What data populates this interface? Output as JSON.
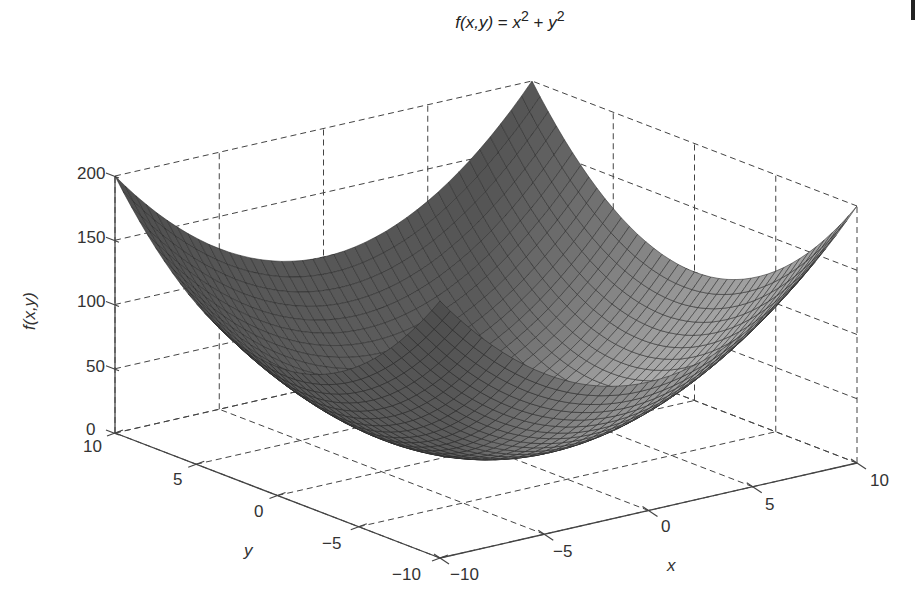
{
  "chart_data": {
    "type": "surface",
    "title_parts": {
      "lhs": "f(x,y)",
      "eq": " = ",
      "x": "x",
      "xexp": "2",
      "plus": " + ",
      "y": "y",
      "yexp": "2"
    },
    "function": "x^2 + y^2",
    "xlabel": "x",
    "ylabel": "y",
    "zlabel": "f(x,y)",
    "xlim": [
      -10,
      10
    ],
    "ylim": [
      -10,
      10
    ],
    "zlim": [
      0,
      200
    ],
    "xticks": [
      "-10",
      "-5",
      "0",
      "5",
      "10"
    ],
    "yticks": [
      "-10",
      "-5",
      "0",
      "5",
      "10"
    ],
    "zticks": [
      "0",
      "50",
      "100",
      "150",
      "200"
    ],
    "grid": true,
    "grid_style": "dashed",
    "mesh_resolution": 41,
    "colormap": "gray",
    "sample_values": [
      {
        "x": -10,
        "y": -10,
        "z": 200
      },
      {
        "x": -10,
        "y": 10,
        "z": 200
      },
      {
        "x": 10,
        "y": -10,
        "z": 200
      },
      {
        "x": 10,
        "y": 10,
        "z": 200
      },
      {
        "x": 0,
        "y": 0,
        "z": 0
      },
      {
        "x": 5,
        "y": 5,
        "z": 50
      },
      {
        "x": -5,
        "y": 5,
        "z": 50
      },
      {
        "x": 10,
        "y": 0,
        "z": 100
      },
      {
        "x": 0,
        "y": 10,
        "z": 100
      }
    ]
  },
  "labels": {
    "x_minus10": "−10",
    "x_minus5": "−5",
    "x_0": "0",
    "x_5": "5",
    "x_10": "10",
    "y_minus10": "−10",
    "y_minus5": "−5",
    "y_0": "0",
    "y_5": "5",
    "y_10": "10",
    "z_0": "0",
    "z_50": "50",
    "z_100": "100",
    "z_150": "150",
    "z_200": "200"
  }
}
